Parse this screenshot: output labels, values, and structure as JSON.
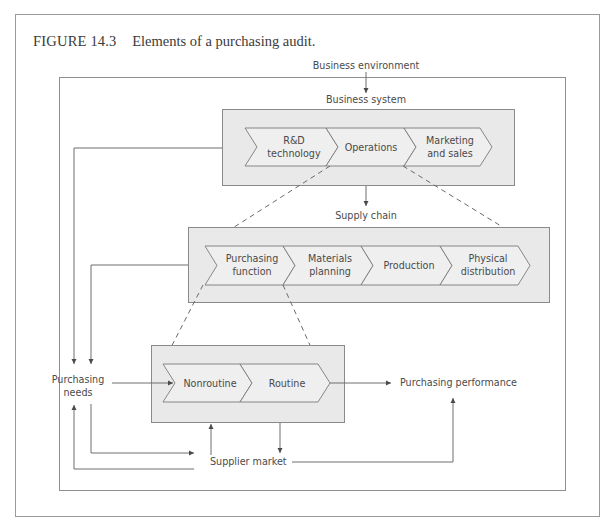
{
  "caption": {
    "number": "FIGURE 14.3",
    "title": "Elements of a purchasing audit."
  },
  "labels": {
    "business_environment": "Business environment",
    "business_system": "Business system",
    "supply_chain": "Supply chain",
    "purchasing_needs_line1": "Purchasing",
    "purchasing_needs_line2": "needs",
    "purchasing_performance": "Purchasing performance",
    "supplier_market": "Supplier market"
  },
  "business_system": {
    "stages": [
      {
        "line1": "R&D",
        "line2": "technology"
      },
      {
        "line1": "Operations",
        "line2": ""
      },
      {
        "line1": "Marketing",
        "line2": "and sales"
      }
    ]
  },
  "supply_chain": {
    "stages": [
      {
        "line1": "Purchasing",
        "line2": "function"
      },
      {
        "line1": "Materials",
        "line2": "planning"
      },
      {
        "line1": "Production",
        "line2": ""
      },
      {
        "line1": "Physical",
        "line2": "distribution"
      }
    ]
  },
  "purchasing_function": {
    "stages": [
      {
        "line1": "Nonroutine",
        "line2": ""
      },
      {
        "line1": "Routine",
        "line2": ""
      }
    ]
  },
  "colors": {
    "box_fill": "#e9e9e9",
    "chevron_fill": "#efefef",
    "line": "#6e6e6e",
    "text": "#4a4a4a"
  }
}
